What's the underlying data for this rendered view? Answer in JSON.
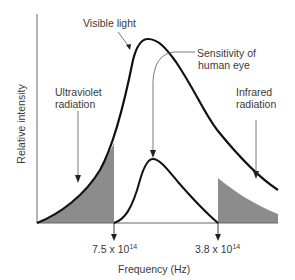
{
  "diagram": {
    "type": "spectrum-curve",
    "axes": {
      "x_label": "Frequency (Hz)",
      "y_label": "Relative intensity",
      "ticks": [
        {
          "base": "7.5 x 10",
          "exp": "14"
        },
        {
          "base": "3.8 x 10",
          "exp": "14"
        }
      ]
    },
    "annotations": {
      "visible_light": "Visible light",
      "sensitivity_line1": "Sensitivity of",
      "sensitivity_line2": "human eye",
      "uv_line1": "Ultraviolet",
      "uv_line2": "radiation",
      "ir_line1": "Infrared",
      "ir_line2": "radiation"
    },
    "colors": {
      "curve": "#111111",
      "shade": "#8c8c8c",
      "axis": "#555555",
      "text": "#3a3a3a"
    }
  }
}
